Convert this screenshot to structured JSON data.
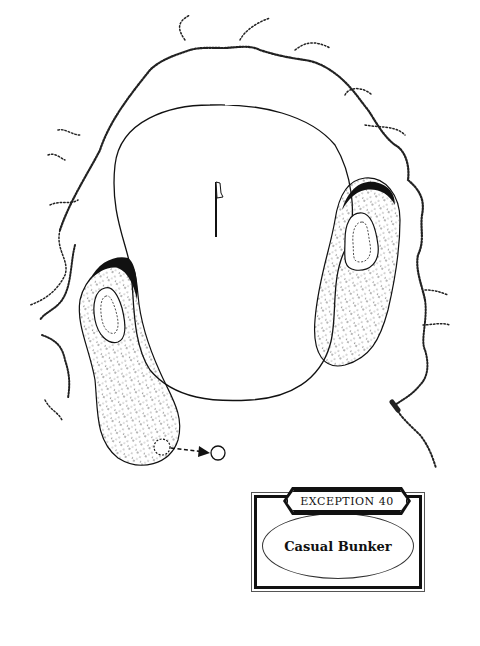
{
  "diagram": {
    "type": "golf-hole-illustration",
    "elements": {
      "green": {
        "label": "putting green",
        "stroke": "#111111"
      },
      "flagstick": {
        "label": "flagstick"
      },
      "left_bunker": {
        "label": "left bunker",
        "fill_pattern": "stippled sand"
      },
      "right_bunker": {
        "label": "right bunker",
        "fill_pattern": "stippled sand"
      },
      "rough": {
        "label": "rough edge",
        "style": "hatched dashed outline"
      },
      "ball_original": {
        "label": "ball in bunker",
        "style": "dashed circle"
      },
      "ball_relief": {
        "label": "relief position",
        "style": "solid circle"
      },
      "relief_arrow": {
        "label": "dashed arrow from bunker to relief"
      }
    },
    "colors": {
      "ink": "#111111",
      "paper": "#ffffff"
    }
  },
  "caption": {
    "header": "EXCEPTION 40",
    "title": "Casual Bunker"
  }
}
